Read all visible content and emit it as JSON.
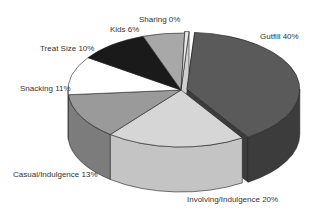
{
  "chart_data": {
    "type": "pie",
    "style": "3d-exploded",
    "title": "",
    "categories": [
      "Gutfill",
      "Involving/Indulgence",
      "Casual/Indulgence",
      "Snacking",
      "Treat Size",
      "Kids",
      "Sharing"
    ],
    "values": [
      40,
      20,
      13,
      11,
      10,
      6,
      0
    ],
    "unit": "%",
    "labels": [
      "Gutfill 40%",
      "Involving/Indulgence 20%",
      "Casual/Indulgence 13%",
      "Snacking 11%",
      "Treat Size 10%",
      "Kids 6%",
      "Sharing 0%"
    ],
    "colors": [
      "#5a5a5a",
      "#d6d6d6",
      "#9a9a9a",
      "#ffffff",
      "#1a1a1a",
      "#a8a8a8",
      "#e8e8e8"
    ],
    "side_colors": [
      "#3c3c3c",
      "#c4c4c4",
      "#7c7c7c",
      "#f4f4f4",
      "#111111",
      "#8a8a8a",
      "#d0d0d0"
    ],
    "exploded": [
      "Gutfill"
    ],
    "legend": "none"
  }
}
